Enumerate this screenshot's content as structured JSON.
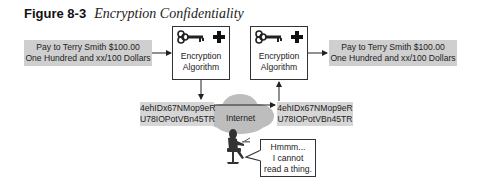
{
  "figure": {
    "number": "Figure 8-3",
    "title": "Encryption Confidentiality"
  },
  "plaintext_left": {
    "line1": "Pay to Terry Smith $100.00",
    "line2": "One Hundred and xx/100 Dollars"
  },
  "plaintext_right": {
    "line1": "Pay to Terry Smith $100.00",
    "line2": "One Hundred and xx/100 Dollars"
  },
  "encrypt_box": {
    "line1": "Encryption",
    "line2": "Algorithm",
    "icons": [
      "key-icon",
      "plus-icon"
    ]
  },
  "decrypt_box": {
    "line1": "Encryption",
    "line2": "Algorithm",
    "icons": [
      "key-icon",
      "plus-icon"
    ]
  },
  "ciphertext_left": {
    "line1": "4ehIDx67NMop9eR",
    "line2": "U78IOPotVBn45TR"
  },
  "ciphertext_right": {
    "line1": "4ehIDx67NMop9eR",
    "line2": "U78IOPotVBn45TR"
  },
  "network": {
    "label": "Internet"
  },
  "eavesdropper": {
    "speech_line1": "Hmmm...",
    "speech_line2": "I cannot",
    "speech_line3": "read a thing."
  },
  "colors": {
    "message_box": "#cfcfcf",
    "cipher_box": "#d6d6d6",
    "cloud": "#bdbdbd",
    "outline": "#333333"
  }
}
